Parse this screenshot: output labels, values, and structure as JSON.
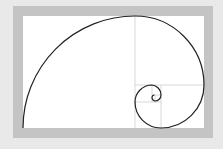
{
  "diagram": {
    "colors": {
      "background": "#e9e9e9",
      "frame": "#c4c4c4",
      "canvas": "#ffffff",
      "grid_lines": "#cfcfcf",
      "spiral": "#222222"
    },
    "rectangle": {
      "x": 23,
      "y": 16,
      "width": 181,
      "height": 112
    },
    "squares": [
      {
        "x": 23,
        "y": 16,
        "size": 112
      },
      {
        "x": 135,
        "y": 16,
        "size": 69
      },
      {
        "x": 161,
        "y": 85,
        "size": 43
      },
      {
        "x": 135,
        "y": 102,
        "size": 26
      },
      {
        "x": 135,
        "y": 85,
        "size": 17
      },
      {
        "x": 152,
        "y": 85,
        "size": 10
      },
      {
        "x": 155,
        "y": 95,
        "size": 6
      }
    ]
  }
}
